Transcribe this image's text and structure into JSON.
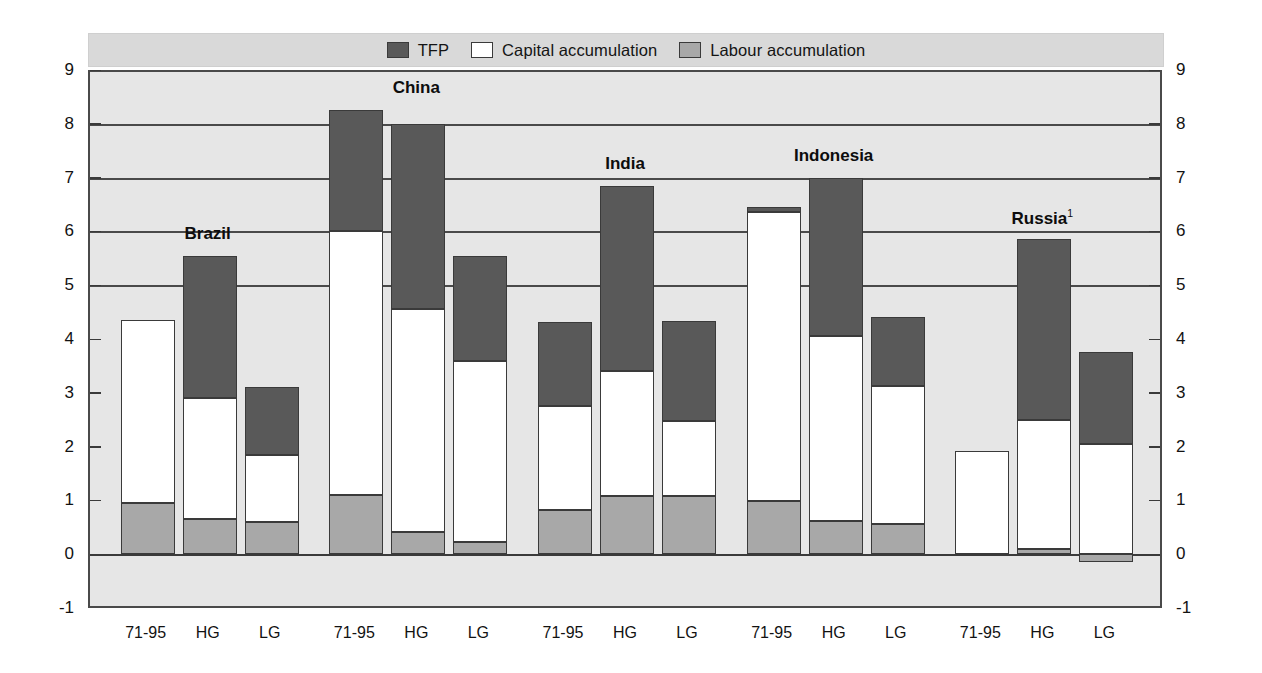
{
  "chart_data": {
    "type": "bar",
    "subtype": "stacked-bar-grouped",
    "title": "",
    "xlabel": "",
    "ylabel": "",
    "ylim": [
      -1,
      9
    ],
    "yticks": [
      -1,
      0,
      1,
      2,
      3,
      4,
      5,
      6,
      7,
      8,
      9
    ],
    "ytick_labels": [
      "-1",
      "0",
      "1",
      "2",
      "3",
      "4",
      "5",
      "6",
      "7",
      "8",
      "9"
    ],
    "grid": true,
    "dual_axis": true,
    "legend_position": "top-center",
    "legend": [
      {
        "name": "TFP",
        "color": "#595959"
      },
      {
        "name": "Capital accumulation",
        "color": "#ffffff"
      },
      {
        "name": "Labour accumulation",
        "color": "#a8a8a8"
      }
    ],
    "series": [
      {
        "name": "Labour accumulation",
        "color": "#a8a8a8"
      },
      {
        "name": "Capital accumulation",
        "color": "#ffffff"
      },
      {
        "name": "TFP",
        "color": "#595959"
      }
    ],
    "groups": [
      {
        "label": "Brazil",
        "footnote": "",
        "bars": [
          {
            "category": "71-95",
            "labour": 0.95,
            "capital": 3.4,
            "tfp": 0.0,
            "total": 4.35
          },
          {
            "category": "HG",
            "labour": 0.65,
            "capital": 2.25,
            "tfp": 2.65,
            "total": 5.55
          },
          {
            "category": "LG",
            "labour": 0.6,
            "capital": 1.25,
            "tfp": 1.25,
            "total": 3.1
          }
        ]
      },
      {
        "label": "China",
        "footnote": "",
        "bars": [
          {
            "category": "71-95",
            "labour": 1.1,
            "capital": 4.9,
            "tfp": 2.25,
            "total": 8.25
          },
          {
            "category": "HG",
            "labour": 0.42,
            "capital": 4.13,
            "tfp": 3.45,
            "total": 8.0
          },
          {
            "category": "LG",
            "labour": 0.22,
            "capital": 3.38,
            "tfp": 1.95,
            "total": 5.55
          }
        ]
      },
      {
        "label": "India",
        "footnote": "",
        "bars": [
          {
            "category": "71-95",
            "labour": 0.82,
            "capital": 1.93,
            "tfp": 1.57,
            "total": 4.32
          },
          {
            "category": "HG",
            "labour": 1.08,
            "capital": 2.32,
            "tfp": 3.45,
            "total": 6.85
          },
          {
            "category": "LG",
            "labour": 1.08,
            "capital": 1.4,
            "tfp": 1.85,
            "total": 4.33
          }
        ]
      },
      {
        "label": "Indonesia",
        "footnote": "",
        "bars": [
          {
            "category": "71-95",
            "labour": 0.98,
            "capital": 5.38,
            "tfp": 0.09,
            "total": 6.45
          },
          {
            "category": "HG",
            "labour": 0.62,
            "capital": 3.43,
            "tfp": 2.95,
            "total": 7.0
          },
          {
            "category": "LG",
            "labour": 0.57,
            "capital": 2.55,
            "tfp": 1.28,
            "total": 4.4
          }
        ]
      },
      {
        "label": "Russia",
        "footnote": "1",
        "bars": [
          {
            "category": "71-95",
            "labour": 0.0,
            "capital": 1.92,
            "tfp": 0.0,
            "total": 1.92
          },
          {
            "category": "HG",
            "labour": 0.1,
            "capital": 2.4,
            "tfp": 3.35,
            "total": 5.85
          },
          {
            "category": "LG",
            "labour": -0.15,
            "capital": 2.05,
            "tfp": 1.7,
            "total": 3.6
          }
        ]
      }
    ]
  },
  "axis": {
    "left_labels": [
      "9",
      "8",
      "7",
      "6",
      "5",
      "4",
      "3",
      "2",
      "1",
      "0",
      "-1"
    ],
    "right_labels": [
      "9",
      "8",
      "7",
      "6",
      "5",
      "4",
      "3",
      "2",
      "1",
      "0",
      "-1"
    ]
  },
  "colors": {
    "tfp": "#595959",
    "capital": "#ffffff",
    "labour": "#a8a8a8",
    "plot_background": "#e6e6e6",
    "legend_background": "#d9d9d9",
    "gridline": "#8a8a8a",
    "axis": "#3a3a3a"
  }
}
